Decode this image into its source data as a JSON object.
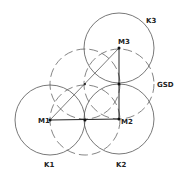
{
  "diagram": {
    "colors": {
      "stroke": "#555555",
      "solid_line": "#222222",
      "dot": "#111111"
    },
    "centers": [
      {
        "id": "M1",
        "label": "M1",
        "x": 50,
        "y": 120
      },
      {
        "id": "M2",
        "label": "M2",
        "x": 119,
        "y": 119
      },
      {
        "id": "M3",
        "label": "M3",
        "x": 119,
        "y": 48
      }
    ],
    "circles": [
      {
        "id": "K1",
        "label": "K1",
        "cx": 50,
        "cy": 120,
        "r": 35
      },
      {
        "id": "K2",
        "label": "K2",
        "cx": 119,
        "cy": 119,
        "r": 35
      },
      {
        "id": "K3",
        "label": "K3",
        "cx": 119,
        "cy": 48,
        "r": 35
      }
    ],
    "dashed_circles": [
      {
        "cx": 85,
        "cy": 120,
        "r": 35
      },
      {
        "cx": 119,
        "cy": 84,
        "r": 35
      },
      {
        "cx": 85,
        "cy": 84,
        "r": 35
      }
    ],
    "midpoints": [
      {
        "x": 85,
        "y": 120
      },
      {
        "x": 119,
        "y": 84
      },
      {
        "x": 85,
        "y": 84
      }
    ],
    "labels": {
      "k1": "K1",
      "k2": "K2",
      "k3": "K3",
      "m1": "M1",
      "m2": "M2",
      "m3": "M3",
      "gsd": "GSD"
    }
  }
}
